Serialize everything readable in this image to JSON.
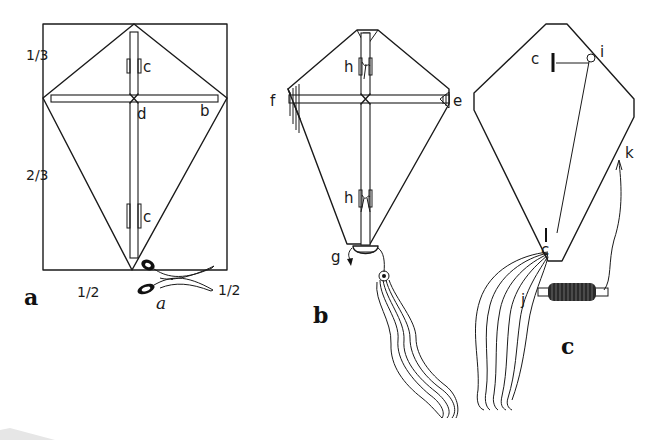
{
  "figure": {
    "colors": {
      "ink": "#1a1a1a",
      "paper": "#ffffff",
      "shadow": "#e6e6e6"
    }
  },
  "panel_a": {
    "label": "a",
    "fraction_top": "1/3",
    "fraction_bottom": "2/3",
    "fraction_base_left": "1/2",
    "fraction_base_right": "1/2",
    "label_clip_top": "c",
    "label_clip_bottom": "c",
    "label_cross": "d",
    "label_crossbar": "b",
    "label_scissors": "a"
  },
  "panel_b": {
    "label": "b",
    "label_left_wing": "f",
    "label_right_wing": "e",
    "label_tie_top": "h",
    "label_tie_bottom": "h",
    "label_bottom": "g"
  },
  "panel_c": {
    "label": "c",
    "label_bridle_top": "c",
    "label_bridle_ring": "i",
    "label_line": "k",
    "label_bottom": "c",
    "label_tail": "j"
  }
}
